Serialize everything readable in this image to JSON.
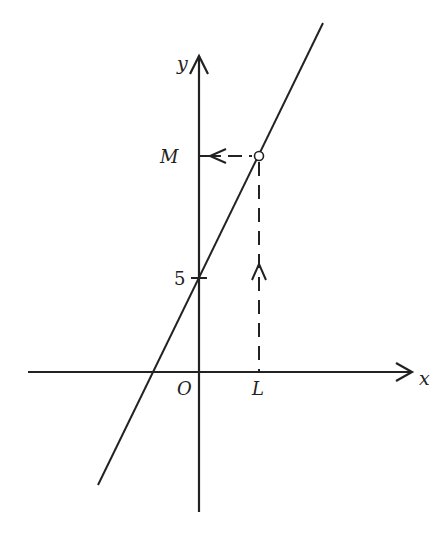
{
  "diagram": {
    "title": "",
    "colors": {
      "stroke": "#222222",
      "background": "#ffffff"
    },
    "axes": {
      "x_label": "x",
      "y_label": "y",
      "origin_label": "O",
      "x_axis": {
        "x1": 28,
        "x2": 412,
        "y": 372
      },
      "y_axis": {
        "x": 199,
        "y1": 512,
        "y2": 56
      }
    },
    "labels": {
      "y_intercept": "5",
      "point_M": "M",
      "point_L": "L"
    },
    "line": {
      "description": "straight line with positive gradient, y-intercept 5",
      "x1": 98,
      "y1": 485,
      "x2": 323,
      "y2": 23
    },
    "y_intercept_tick_y": 278,
    "marked_point": {
      "x": 259,
      "y": 156
    },
    "dashed_vertical": {
      "x": 259,
      "y_top": 162,
      "y_bottom": 372,
      "arrow": "up"
    },
    "dashed_horizontal": {
      "y": 156,
      "x_left": 199,
      "x_right": 253,
      "arrow": "left"
    }
  }
}
